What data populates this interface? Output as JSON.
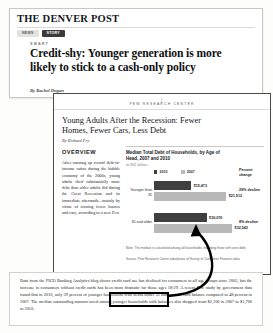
{
  "newspaper": {
    "masthead": "THE DENVER POST",
    "nav": [
      {
        "label": "News",
        "active": false
      },
      {
        "label": "Story",
        "active": true
      }
    ],
    "kicker": "SMART",
    "headline": "Credit-shy: Younger generation is more likely to stick to a cash-only policy",
    "byline": "By Rachel Dugan"
  },
  "pew": {
    "logo_mark": "|",
    "logo_text": "PEW RESEARCH CENTER",
    "report_title": "Young Adults After the Recession: Fewer Homes, Fewer Cars, Less Debt",
    "report_author": "By Richard Fry",
    "overview_heading": "OVERVIEW",
    "overview_body": "After running up record debt-to-income ratios during the bubble economy of the 2000s, young adults shed substantially more debt than older adults did during the Great Recession and its immediate aftermath—mainly by virtue of owning fewer houses and cars, according to a new Pew"
  },
  "chart_data": {
    "type": "bar",
    "title": "Median Total Debt of Households, by Age of Head, 2007 and 2010",
    "subtitle": "in 2011 dollars",
    "orientation": "horizontal",
    "categories": [
      "Younger than 35",
      "35 and older"
    ],
    "series": [
      {
        "name": "2010",
        "color": "#3f3f3f",
        "values": [
          15473,
          21912
        ]
      },
      {
        "name": "2007",
        "color": "#b9b9b9",
        "values": [
          30070,
          32543
        ]
      }
    ],
    "value_labels": [
      {
        "category": "Younger than 35",
        "2010": "$15,473",
        "2007": "$21,912"
      },
      {
        "category": "35 and older",
        "2010": "$30,070",
        "2007": "$32,543"
      }
    ],
    "percent_change_header": "Percent change",
    "percent_change": [
      "29% decline",
      "8% decline"
    ],
    "xlim": [
      0,
      35000
    ],
    "grid": false,
    "legend_position": "top",
    "note": "Note: The median is calculated among all households, including those with zero debt.",
    "source": "Source: Pew Research Center tabulations of Survey of Consumer Finances data"
  },
  "bottom_article": {
    "body": "Data from the FICO Banking Analytics blog shows credit card use has declined for consumers in all age groups since 2005, but the increase in consumers without credit cards has been most dramatic for those ages 18-29. A recent Pew study by government data found that in 2010, only 39 percent of younger households with heads under 35 had a credit-card balance compared to 48 percent in 2007. The median outstanding amount owed among younger households with balances also dropped from $2,100 in 2007 to $1,700 in 2010."
  },
  "annotation": {
    "highlight_text": "recent Pew study",
    "arrow_description": "curved arrow from highlighted text to chart"
  }
}
